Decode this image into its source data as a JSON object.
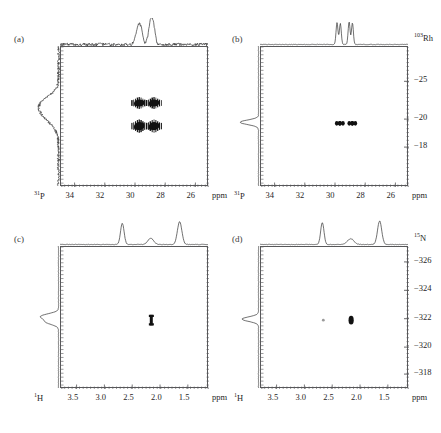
{
  "figure": {
    "type": "multi-panel-2d-nmr-spectra",
    "panel_count": 4,
    "background": "#ffffff",
    "trace_color": "#333333",
    "box_color": "#58585a"
  },
  "panels": [
    {
      "id": "a",
      "label": "(a)",
      "x_nucleus": "31P",
      "x_nucleus_sup": "31",
      "x_nucleus_base": "P",
      "x_unit": "ppm",
      "x_ticks": [
        "34",
        "32",
        "30",
        "28",
        "26"
      ],
      "x_tick_values": [
        34,
        32,
        30,
        28,
        26
      ],
      "x_range": [
        34.9,
        25.1
      ],
      "y_nucleus": "",
      "y_nucleus_sup": "",
      "y_nucleus_base": "",
      "y_ticks": [],
      "y_tick_values": [],
      "y_unit": "",
      "has_right_axis": false,
      "peaks_2d": [
        {
          "x": 29.72,
          "y": 0.4,
          "w": 0.3,
          "h": 0.085,
          "shape": "multiplet"
        },
        {
          "x": 28.74,
          "y": 0.4,
          "w": 0.3,
          "h": 0.085,
          "shape": "multiplet"
        },
        {
          "x": 29.72,
          "y": 0.565,
          "w": 0.3,
          "h": 0.095,
          "shape": "multiplet"
        },
        {
          "x": 28.74,
          "y": 0.565,
          "w": 0.3,
          "h": 0.095,
          "shape": "multiplet"
        }
      ],
      "top_trace_peaks": [
        {
          "x": 29.72,
          "height": 0.72,
          "width": 0.14
        },
        {
          "x": 29.52,
          "height": 0.38,
          "width": 0.1
        },
        {
          "x": 28.88,
          "height": 0.95,
          "width": 0.13
        },
        {
          "x": 28.7,
          "height": 0.45,
          "width": 0.1
        }
      ],
      "left_trace_peaks": [
        {
          "y": 0.47,
          "height": 0.8,
          "width": 0.075
        },
        {
          "y": 0.4,
          "height": 0.34,
          "width": 0.05
        }
      ],
      "top_trace_noisy": true,
      "left_trace_noisy": true
    },
    {
      "id": "b",
      "label": "(b)",
      "x_nucleus": "31P",
      "x_nucleus_sup": "31",
      "x_nucleus_base": "P",
      "x_unit": "ppm",
      "x_ticks": [
        "34",
        "32",
        "30",
        "28",
        "26"
      ],
      "x_tick_values": [
        34,
        32,
        30,
        28,
        26
      ],
      "x_range": [
        34.9,
        25.1
      ],
      "y_nucleus": "103Rh",
      "y_nucleus_sup": "103",
      "y_nucleus_base": "Rh",
      "y_ticks": [
        "−25",
        "−20",
        "−18"
      ],
      "y_tick_positions": [
        0.245,
        0.515,
        0.715
      ],
      "y_unit": "",
      "has_right_axis": true,
      "peaks_2d": [
        {
          "x": 29.78,
          "y": 0.545,
          "w": 0.16,
          "h": 0.035,
          "shape": "dot-pair"
        },
        {
          "x": 29.58,
          "y": 0.545,
          "w": 0.16,
          "h": 0.035,
          "shape": "dot-pair"
        },
        {
          "x": 28.95,
          "y": 0.545,
          "w": 0.16,
          "h": 0.035,
          "shape": "dot-pair"
        },
        {
          "x": 28.76,
          "y": 0.545,
          "w": 0.16,
          "h": 0.035,
          "shape": "dot-pair"
        }
      ],
      "top_trace_peaks": [
        {
          "x": 29.8,
          "height": 0.92,
          "width": 0.055
        },
        {
          "x": 29.58,
          "height": 0.88,
          "width": 0.055
        },
        {
          "x": 29.0,
          "height": 0.95,
          "width": 0.055
        },
        {
          "x": 28.78,
          "height": 0.9,
          "width": 0.055
        }
      ],
      "left_trace_peaks": [
        {
          "y": 0.545,
          "height": 0.92,
          "width": 0.016
        }
      ],
      "top_trace_noisy": false,
      "left_trace_noisy": false
    },
    {
      "id": "c",
      "label": "(c)",
      "x_nucleus": "1H",
      "x_nucleus_sup": "1",
      "x_nucleus_base": "H",
      "x_unit": "ppm",
      "x_ticks": [
        "3.5",
        "3.0",
        "2.5",
        "2.0",
        "1.5"
      ],
      "x_tick_values": [
        3.5,
        3.0,
        2.5,
        2.0,
        1.5
      ],
      "x_range": [
        3.78,
        1.12
      ],
      "y_nucleus": "",
      "y_nucleus_sup": "",
      "y_nucleus_base": "",
      "y_ticks": [],
      "y_tick_values": [],
      "y_unit": "",
      "has_right_axis": false,
      "peaks_2d": [
        {
          "x": 2.16,
          "y": 0.515,
          "w": 0.055,
          "h": 0.075,
          "shape": "bar"
        }
      ],
      "top_trace_peaks": [
        {
          "x": 2.66,
          "height": 0.88,
          "width": 0.028
        },
        {
          "x": 2.15,
          "height": 0.26,
          "width": 0.045
        },
        {
          "x": 1.63,
          "height": 0.95,
          "width": 0.035
        }
      ],
      "left_trace_peaks": [
        {
          "y": 0.495,
          "height": 0.85,
          "width": 0.018
        },
        {
          "y": 0.535,
          "height": 0.6,
          "width": 0.018
        }
      ],
      "top_trace_noisy": false,
      "left_trace_noisy": false
    },
    {
      "id": "d",
      "label": "(d)",
      "x_nucleus": "1H",
      "x_nucleus_sup": "1",
      "x_nucleus_base": "H",
      "x_unit": "ppm",
      "x_ticks": [
        "3.5",
        "3.0",
        "2.5",
        "2.0",
        "1.5"
      ],
      "x_tick_values": [
        3.5,
        3.0,
        2.5,
        2.0,
        1.5
      ],
      "x_range": [
        3.78,
        1.12
      ],
      "y_nucleus": "15N",
      "y_nucleus_sup": "15",
      "y_nucleus_base": "N",
      "y_ticks": [
        "−326",
        "−324",
        "−322",
        "−320",
        "−318"
      ],
      "y_tick_positions": [
        0.105,
        0.305,
        0.505,
        0.705,
        0.895
      ],
      "y_unit": "",
      "has_right_axis": true,
      "peaks_2d": [
        {
          "x": 2.16,
          "y": 0.515,
          "w": 0.06,
          "h": 0.055,
          "shape": "dot"
        },
        {
          "x": 2.66,
          "y": 0.515,
          "w": 0.018,
          "h": 0.018,
          "shape": "faint-dot"
        }
      ],
      "top_trace_peaks": [
        {
          "x": 2.66,
          "height": 0.92,
          "width": 0.026
        },
        {
          "x": 2.15,
          "height": 0.24,
          "width": 0.05
        },
        {
          "x": 1.63,
          "height": 0.98,
          "width": 0.033
        }
      ],
      "left_trace_peaks": [
        {
          "y": 0.515,
          "height": 0.82,
          "width": 0.016
        }
      ],
      "top_trace_noisy": false,
      "left_trace_noisy": false
    }
  ],
  "chart_data": {
    "type": "scatter",
    "title": "",
    "subtitle": "",
    "panels": [
      {
        "name": "(a)",
        "xlabel": "31P",
        "xunit": "ppm",
        "xlim": [
          34.9,
          25.1
        ],
        "xticks": [
          34,
          32,
          30,
          28,
          26
        ],
        "ylabel": "",
        "yticks": [],
        "ylim": [],
        "cross_peaks": [
          {
            "x": 29.72,
            "y": null
          },
          {
            "x": 28.74,
            "y": null
          },
          {
            "x": 29.72,
            "y": null
          },
          {
            "x": 28.74,
            "y": null
          }
        ],
        "grid": false,
        "legend": "none"
      },
      {
        "name": "(b)",
        "xlabel": "31P",
        "xunit": "ppm",
        "xlim": [
          34.9,
          25.1
        ],
        "xticks": [
          34,
          32,
          30,
          28,
          26
        ],
        "ylabel": "103Rh",
        "yticks": [
          -25,
          -20,
          -18
        ],
        "ylim": [
          -27.5,
          -16.5
        ],
        "cross_peaks": [
          {
            "x": 29.78,
            "y": -20.3
          },
          {
            "x": 29.58,
            "y": -20.3
          },
          {
            "x": 28.95,
            "y": -20.3
          },
          {
            "x": 28.76,
            "y": -20.3
          }
        ],
        "grid": false,
        "legend": "none"
      },
      {
        "name": "(c)",
        "xlabel": "1H",
        "xunit": "ppm",
        "xlim": [
          3.78,
          1.12
        ],
        "xticks": [
          3.5,
          3.0,
          2.5,
          2.0,
          1.5
        ],
        "ylabel": "",
        "yticks": [],
        "ylim": [],
        "cross_peaks": [
          {
            "x": 2.16,
            "y": null
          }
        ],
        "grid": false,
        "legend": "none"
      },
      {
        "name": "(d)",
        "xlabel": "1H",
        "xunit": "ppm",
        "xlim": [
          3.78,
          1.12
        ],
        "xticks": [
          3.5,
          3.0,
          2.5,
          2.0,
          1.5
        ],
        "ylabel": "15N",
        "yticks": [
          -326,
          -324,
          -322,
          -320,
          -318
        ],
        "ylim": [
          -327,
          -317
        ],
        "cross_peaks": [
          {
            "x": 2.16,
            "y": -322.0
          },
          {
            "x": 2.66,
            "y": -322.0
          }
        ],
        "grid": false,
        "legend": "none"
      }
    ]
  }
}
